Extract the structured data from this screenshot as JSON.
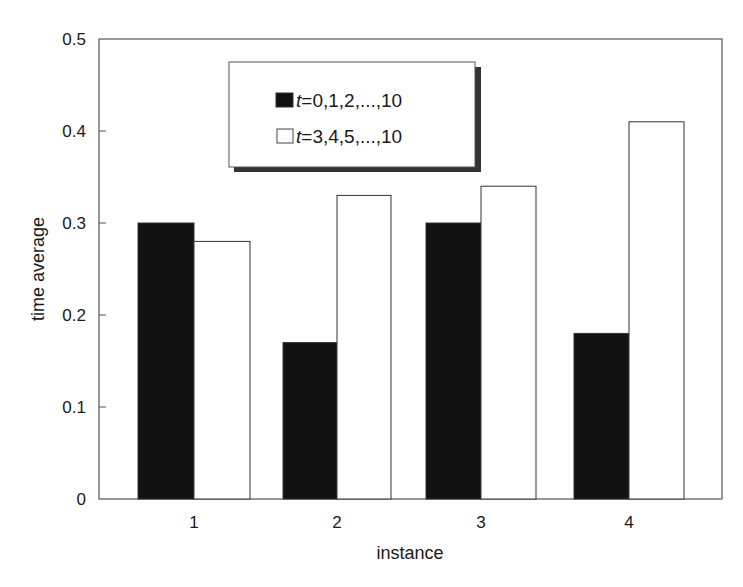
{
  "chart_data": {
    "type": "bar",
    "title": "",
    "xlabel": "instance",
    "ylabel": "time average",
    "categories": [
      "1",
      "2",
      "3",
      "4"
    ],
    "series": [
      {
        "name": "t=0,1,2,...,10",
        "name_italic_part": "t",
        "name_rest": "=0,1,2,...,10",
        "fill": "#111111",
        "values": [
          0.3,
          0.17,
          0.3,
          0.18
        ]
      },
      {
        "name": "t=3,4,5,...,10",
        "name_italic_part": "t",
        "name_rest": "=3,4,5,...,10",
        "fill": "#ffffff",
        "values": [
          0.28,
          0.33,
          0.34,
          0.41
        ]
      }
    ],
    "ylim": [
      0,
      0.5
    ],
    "yticks": [
      "0",
      "0.1",
      "0.2",
      "0.3",
      "0.4",
      "0.5"
    ],
    "ytick_values": [
      0,
      0.1,
      0.2,
      0.3,
      0.4,
      0.5
    ],
    "grid": false,
    "legend_position": "upper-left-center, boxed with drop shadow"
  }
}
